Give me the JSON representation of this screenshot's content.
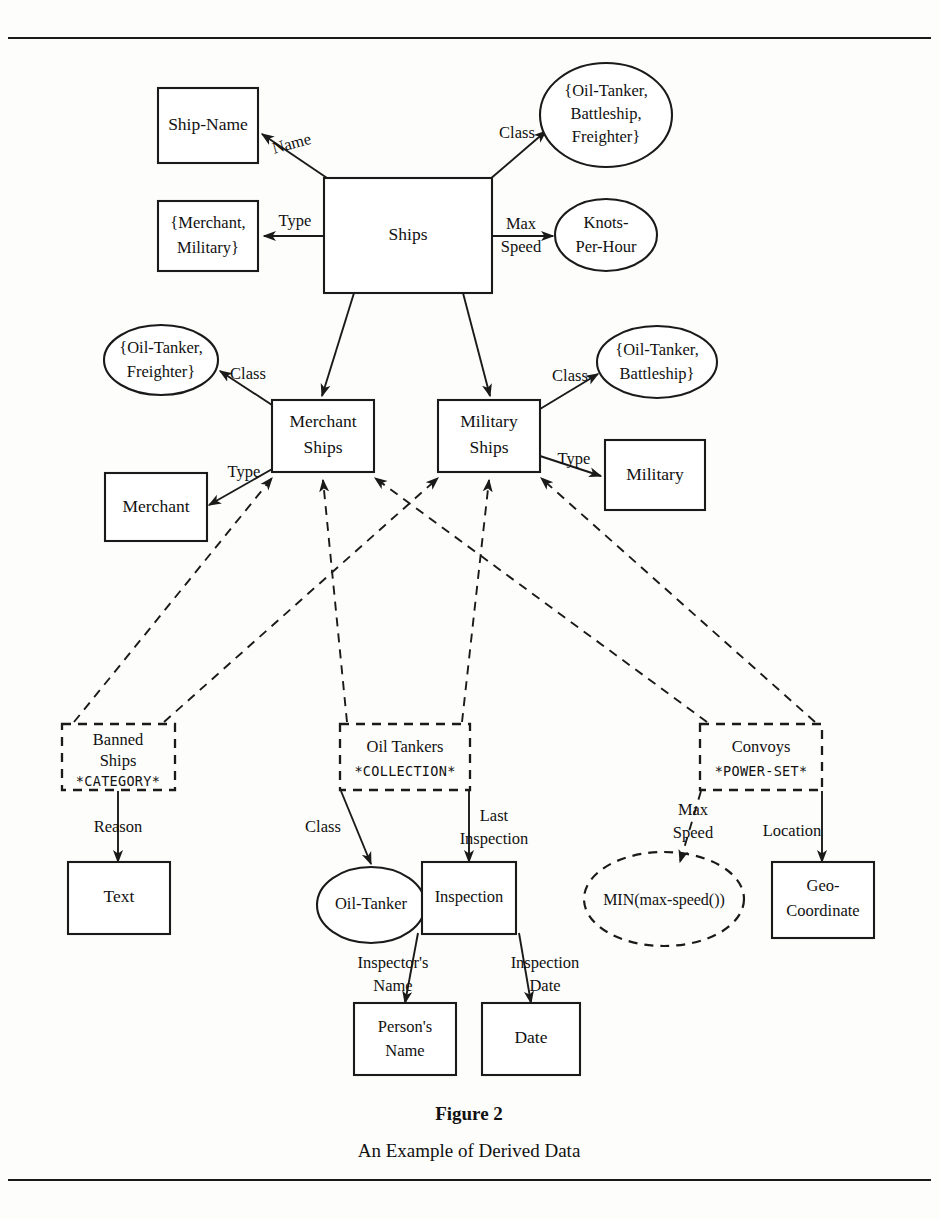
{
  "figure": {
    "caption_title": "Figure 2",
    "caption_subtitle": "An Example of Derived Data",
    "ink_color": "#1a1a1a",
    "background_color": "#fdfdfb"
  },
  "nodes": {
    "ship_name": {
      "label": "Ship-Name",
      "shape": "rect"
    },
    "type_enum": {
      "line1": "{Merchant,",
      "line2": "Military}",
      "shape": "rect"
    },
    "ships": {
      "label": "Ships",
      "shape": "rect"
    },
    "class_enum_all": {
      "line1": "{Oil-Tanker,",
      "line2": "Battleship,",
      "line3": "Freighter}",
      "shape": "ellipse"
    },
    "knots": {
      "line1": "Knots-",
      "line2": "Per-Hour",
      "shape": "ellipse"
    },
    "class_enum_merchant": {
      "line1": "{Oil-Tanker,",
      "line2": "Freighter}",
      "shape": "ellipse"
    },
    "class_enum_military": {
      "line1": "{Oil-Tanker,",
      "line2": "Battleship}",
      "shape": "ellipse"
    },
    "merchant_ships": {
      "line1": "Merchant",
      "line2": "Ships",
      "shape": "rect"
    },
    "military_ships": {
      "line1": "Military",
      "line2": "Ships",
      "shape": "rect"
    },
    "merchant": {
      "label": "Merchant",
      "shape": "rect"
    },
    "military": {
      "label": "Military",
      "shape": "rect"
    },
    "banned_ships": {
      "line1": "Banned",
      "line2": "Ships",
      "stereotype": "*CATEGORY*",
      "shape": "rect-dashed"
    },
    "oil_tankers": {
      "line1": "Oil Tankers",
      "stereotype": "*COLLECTION*",
      "shape": "rect-dashed"
    },
    "convoys": {
      "line1": "Convoys",
      "stereotype": "*POWER-SET*",
      "shape": "rect-dashed"
    },
    "text": {
      "label": "Text",
      "shape": "rect"
    },
    "oil_tanker": {
      "label": "Oil-Tanker",
      "shape": "ellipse"
    },
    "inspection": {
      "label": "Inspection",
      "shape": "rect"
    },
    "min_max_speed": {
      "label": "MIN(max-speed())",
      "shape": "ellipse-dashed"
    },
    "geo_coordinate": {
      "line1": "Geo-",
      "line2": "Coordinate",
      "shape": "rect"
    },
    "persons_name": {
      "line1": "Person's",
      "line2": "Name",
      "shape": "rect"
    },
    "date": {
      "label": "Date",
      "shape": "rect"
    }
  },
  "edges": [
    {
      "id": "ships-name",
      "label": "Name",
      "from": "ships",
      "to": "ship_name",
      "style": "solid"
    },
    {
      "id": "ships-type",
      "label": "Type",
      "from": "ships",
      "to": "type_enum",
      "style": "solid"
    },
    {
      "id": "ships-class",
      "label": "Class",
      "from": "ships",
      "to": "class_enum_all",
      "style": "solid"
    },
    {
      "id": "ships-maxspeed",
      "label_line1": "Max",
      "label_line2": "Speed",
      "from": "ships",
      "to": "knots",
      "style": "solid"
    },
    {
      "id": "ships-merchant-ships",
      "label": "",
      "from": "ships",
      "to": "merchant_ships",
      "style": "solid"
    },
    {
      "id": "ships-military-ships",
      "label": "",
      "from": "ships",
      "to": "military_ships",
      "style": "solid"
    },
    {
      "id": "merchant-class",
      "label": "Class",
      "from": "merchant_ships",
      "to": "class_enum_merchant",
      "style": "solid"
    },
    {
      "id": "merchant-type",
      "label": "Type",
      "from": "merchant_ships",
      "to": "merchant",
      "style": "solid"
    },
    {
      "id": "military-class",
      "label": "Class",
      "from": "military_ships",
      "to": "class_enum_military",
      "style": "solid"
    },
    {
      "id": "military-type",
      "label": "Type",
      "from": "military_ships",
      "to": "military",
      "style": "solid"
    },
    {
      "id": "banned-to-merchant",
      "label": "",
      "from": "banned_ships",
      "to": "merchant_ships",
      "style": "dashed"
    },
    {
      "id": "banned-to-military",
      "label": "",
      "from": "banned_ships",
      "to": "military_ships",
      "style": "dashed"
    },
    {
      "id": "oiltankers-to-merchant",
      "label": "",
      "from": "oil_tankers",
      "to": "merchant_ships",
      "style": "dashed"
    },
    {
      "id": "oiltankers-to-military",
      "label": "",
      "from": "oil_tankers",
      "to": "military_ships",
      "style": "dashed"
    },
    {
      "id": "convoys-to-merchant",
      "label": "",
      "from": "convoys",
      "to": "merchant_ships",
      "style": "dashed"
    },
    {
      "id": "convoys-to-military",
      "label": "",
      "from": "convoys",
      "to": "military_ships",
      "style": "dashed"
    },
    {
      "id": "banned-reason",
      "label": "Reason",
      "from": "banned_ships",
      "to": "text",
      "style": "solid"
    },
    {
      "id": "oiltankers-class",
      "label": "Class",
      "from": "oil_tankers",
      "to": "oil_tanker",
      "style": "solid"
    },
    {
      "id": "oiltankers-lastinspection",
      "label_line1": "Last",
      "label_line2": "Inspection",
      "from": "oil_tankers",
      "to": "inspection",
      "style": "solid"
    },
    {
      "id": "convoys-maxspeed",
      "label_line1": "Max",
      "label_line2": "Speed",
      "from": "convoys",
      "to": "min_max_speed",
      "style": "dashed"
    },
    {
      "id": "convoys-location",
      "label": "Location",
      "from": "convoys",
      "to": "geo_coordinate",
      "style": "solid"
    },
    {
      "id": "inspection-inspectorsname",
      "label_line1": "Inspector's",
      "label_line2": "Name",
      "from": "inspection",
      "to": "persons_name",
      "style": "solid"
    },
    {
      "id": "inspection-inspectiondate",
      "label_line1": "Inspection",
      "label_line2": "Date",
      "from": "inspection",
      "to": "date",
      "style": "solid"
    }
  ]
}
